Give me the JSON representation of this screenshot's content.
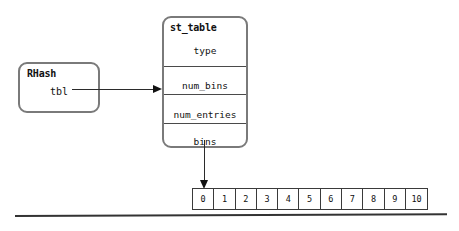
{
  "diagram": {
    "rhash_struct": {
      "title": "RHash",
      "fields": [
        "tbl"
      ]
    },
    "st_table_struct": {
      "title": "st_table",
      "fields": [
        "type",
        "num_bins",
        "num_entries",
        "bins"
      ]
    },
    "bins_array": {
      "cells": [
        "0",
        "1",
        "2",
        "3",
        "4",
        "5",
        "6",
        "7",
        "8",
        "9",
        "10"
      ]
    },
    "connectors": {
      "tbl_to_sttable": "arrow-right",
      "bins_to_array": "arrow-down"
    },
    "colors": {
      "box_border": "#7a7a7a",
      "divider": "#4a4a4a",
      "arrow": "#111111",
      "cell_border": "#3a3a3a",
      "rule": "#333333",
      "text": "#111111",
      "background": "#ffffff"
    }
  }
}
